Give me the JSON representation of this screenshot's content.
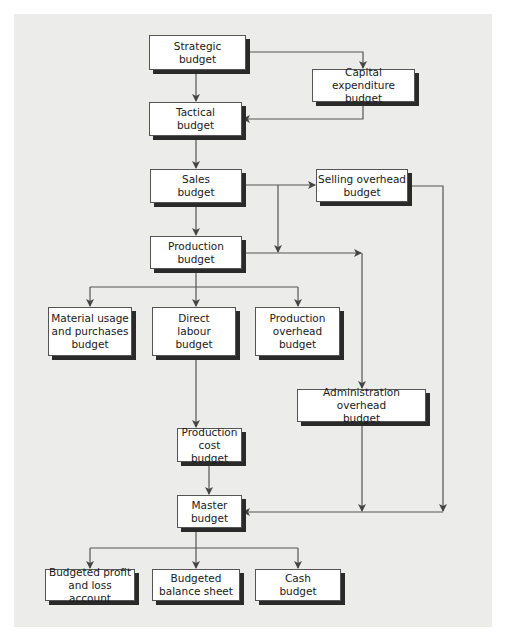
{
  "diagram": {
    "nodes": {
      "strategic": "Strategic\nbudget",
      "capital": "Capital expenditure\nbudget",
      "tactical": "Tactical\nbudget",
      "sales": "Sales\nbudget",
      "selling": "Selling overhead\nbudget",
      "production": "Production\nbudget",
      "material": "Material usage\nand purchases\nbudget",
      "labour": "Direct\nlabour\nbudget",
      "prod_overhead": "Production\noverhead\nbudget",
      "admin": "Administration overhead\nbudget",
      "prod_cost": "Production cost\nbudget",
      "master": "Master\nbudget",
      "profit_loss": "Budgeted profit\nand loss account",
      "balance": "Budgeted\nbalance sheet",
      "cash": "Cash\nbudget"
    },
    "edges": [
      [
        "strategic",
        "tactical"
      ],
      [
        "strategic",
        "capital"
      ],
      [
        "capital",
        "tactical"
      ],
      [
        "tactical",
        "sales"
      ],
      [
        "sales",
        "selling"
      ],
      [
        "sales",
        "production"
      ],
      [
        "production",
        "material"
      ],
      [
        "production",
        "labour"
      ],
      [
        "production",
        "prod_overhead"
      ],
      [
        "production",
        "admin"
      ],
      [
        "labour",
        "prod_cost"
      ],
      [
        "prod_cost",
        "master"
      ],
      [
        "admin",
        "master"
      ],
      [
        "selling",
        "master"
      ],
      [
        "master",
        "profit_loss"
      ],
      [
        "master",
        "balance"
      ],
      [
        "master",
        "cash"
      ]
    ],
    "colors": {
      "panel": "#ececea",
      "box": "#ffffff",
      "line": "#444444",
      "shadow": "#2a2a2a"
    }
  }
}
